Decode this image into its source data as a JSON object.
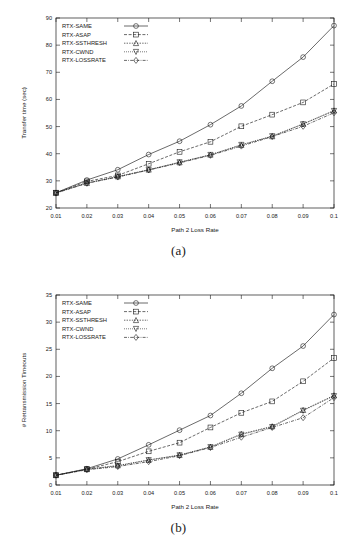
{
  "figure": {
    "captions": {
      "a": "(a)",
      "b": "(b)"
    }
  },
  "chart_data": [
    {
      "type": "line",
      "panel": "(a)",
      "title": "",
      "xlabel": "Path 2 Loss Rate",
      "ylabel": "Transfer time (sec)",
      "x": [
        0.01,
        0.02,
        0.03,
        0.04,
        0.05,
        0.06,
        0.07,
        0.08,
        0.09,
        0.1
      ],
      "xticklabels": [
        "0.01",
        "0.02",
        "0.03",
        "0.04",
        "0.05",
        "0.06",
        "0.07",
        "0.08",
        "0.09",
        "0.1"
      ],
      "yticklabels": [
        "20",
        "30",
        "40",
        "50",
        "60",
        "70",
        "80",
        "90"
      ],
      "xlim": [
        0.01,
        0.1
      ],
      "ylim": [
        20,
        90
      ],
      "grid": false,
      "legend_position": "top-left",
      "series": [
        {
          "name": "RTX-SAME",
          "marker": "circle",
          "values": [
            25.6,
            30.3,
            34.1,
            39.7,
            44.6,
            50.7,
            57.6,
            66.7,
            75.6,
            87.2
          ]
        },
        {
          "name": "RTX-ASAP",
          "marker": "square",
          "values": [
            25.6,
            29.8,
            32.0,
            36.3,
            40.7,
            44.4,
            50.1,
            54.4,
            58.9,
            65.7
          ]
        },
        {
          "name": "RTX-SSTHRESH",
          "marker": "triangle-up",
          "values": [
            25.6,
            29.2,
            31.6,
            34.1,
            36.8,
            39.6,
            43.2,
            46.4,
            51.0,
            55.9
          ]
        },
        {
          "name": "RTX-CWND",
          "marker": "triangle-down",
          "values": [
            25.6,
            29.2,
            31.5,
            34.0,
            36.9,
            39.6,
            43.3,
            46.5,
            50.9,
            55.8
          ]
        },
        {
          "name": "RTX-LOSSRATE",
          "marker": "diamond",
          "values": [
            25.5,
            29.1,
            31.4,
            34.0,
            36.6,
            39.4,
            42.8,
            46.3,
            50.1,
            55.1
          ]
        }
      ]
    },
    {
      "type": "line",
      "panel": "(b)",
      "title": "",
      "xlabel": "Path 2 Loss Rate",
      "ylabel": "# Retransmission Timeouts",
      "x": [
        0.01,
        0.02,
        0.03,
        0.04,
        0.05,
        0.06,
        0.07,
        0.08,
        0.09,
        0.1
      ],
      "xticklabels": [
        "0.01",
        "0.02",
        "0.03",
        "0.04",
        "0.05",
        "0.06",
        "0.07",
        "0.08",
        "0.09",
        "0.1"
      ],
      "yticklabels": [
        "0",
        "5",
        "10",
        "15",
        "20",
        "25",
        "30",
        "35"
      ],
      "xlim": [
        0.01,
        0.1
      ],
      "ylim": [
        0,
        35
      ],
      "grid": false,
      "legend_position": "top-left",
      "series": [
        {
          "name": "RTX-SAME",
          "marker": "circle",
          "values": [
            1.8,
            3.0,
            4.8,
            7.4,
            10.1,
            12.8,
            16.9,
            21.5,
            25.6,
            31.4
          ]
        },
        {
          "name": "RTX-ASAP",
          "marker": "square",
          "values": [
            1.8,
            2.9,
            4.3,
            6.2,
            7.8,
            10.6,
            13.3,
            15.4,
            19.1,
            23.4
          ]
        },
        {
          "name": "RTX-SSTHRESH",
          "marker": "triangle-up",
          "values": [
            1.8,
            2.9,
            3.6,
            4.6,
            5.5,
            7.0,
            9.4,
            10.8,
            13.8,
            16.5
          ]
        },
        {
          "name": "RTX-CWND",
          "marker": "triangle-down",
          "values": [
            1.8,
            2.9,
            3.5,
            4.6,
            5.5,
            7.0,
            9.3,
            10.7,
            13.7,
            16.4
          ]
        },
        {
          "name": "RTX-LOSSRATE",
          "marker": "diamond",
          "values": [
            1.8,
            2.8,
            3.4,
            4.3,
            5.4,
            6.9,
            8.8,
            10.6,
            12.4,
            16.1
          ]
        }
      ]
    }
  ]
}
